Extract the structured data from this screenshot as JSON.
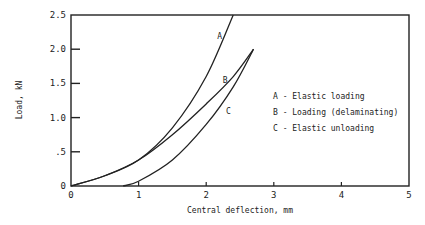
{
  "chart_data": {
    "type": "line",
    "title": "",
    "xlabel": "Central deflection, mm",
    "ylabel": "Load, kN",
    "xlim": [
      0,
      5
    ],
    "ylim": [
      0,
      2.5
    ],
    "x_ticks": [
      "0",
      "1",
      "2",
      "3",
      "4",
      "5"
    ],
    "y_ticks": [
      "0",
      ".5",
      "1.0",
      "1.5",
      "2.0",
      "2.5"
    ],
    "grid": false,
    "legend_position": "right-inside",
    "series": [
      {
        "name": "A",
        "label": "A - Elastic loading",
        "x": [
          0,
          0.5,
          1.0,
          1.5,
          2.0,
          2.4
        ],
        "y": [
          0,
          0.15,
          0.38,
          0.85,
          1.6,
          2.5
        ]
      },
      {
        "name": "B",
        "label": "B - Loading (delaminating)",
        "x": [
          0,
          0.5,
          1.0,
          1.5,
          2.0,
          2.4,
          2.7
        ],
        "y": [
          0,
          0.15,
          0.38,
          0.75,
          1.2,
          1.6,
          2.0
        ]
      },
      {
        "name": "C",
        "label": "C - Elastic unloading",
        "x": [
          0.77,
          1.0,
          1.5,
          2.0,
          2.4,
          2.7
        ],
        "y": [
          0,
          0.07,
          0.38,
          0.9,
          1.45,
          2.0
        ]
      }
    ],
    "annotations": [
      {
        "text": "A",
        "x": 2.2,
        "y": 2.15
      },
      {
        "text": "B",
        "x": 2.28,
        "y": 1.5
      },
      {
        "text": "C",
        "x": 2.33,
        "y": 1.05
      }
    ]
  },
  "legend": {
    "a": "A - Elastic loading",
    "b": "B - Loading (delaminating)",
    "c": "C - Elastic unloading"
  }
}
